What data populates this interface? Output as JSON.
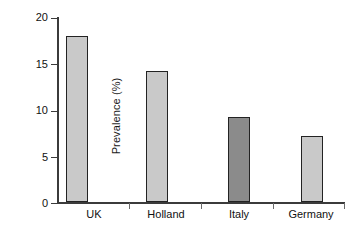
{
  "chart_data": {
    "type": "bar",
    "title": "",
    "subtitle": "",
    "xlabel": "",
    "ylabel": "Prevalence (%)",
    "categories": [
      "UK",
      "Holland",
      "Italy",
      "Germany"
    ],
    "values": [
      18.0,
      14.2,
      9.2,
      7.2
    ],
    "series": [
      {
        "name": "Prevalence",
        "values": [
          18.0,
          14.2,
          9.2,
          7.2
        ]
      }
    ],
    "ylim": [
      0,
      20
    ],
    "yticks": [
      0,
      5,
      10,
      15,
      20
    ],
    "ytick_labels": [
      "0",
      "5",
      "10",
      "15",
      "20"
    ],
    "grid": false,
    "legend": "none",
    "bar_colors": [
      "#c9c9c9",
      "#c9c9c9",
      "#8b8b8b",
      "#c9c9c9"
    ],
    "bar_edge_color": "#232323",
    "axis_color": "#3b3b3b",
    "highlighted_category": "Italy"
  },
  "axes": {
    "y_title": "Prevalence (%)",
    "y_tick_labels": [
      "20",
      "15",
      "10",
      "5",
      "0"
    ],
    "x_tick_labels": [
      "UK",
      "Holland",
      "Italy",
      "Germany"
    ]
  }
}
